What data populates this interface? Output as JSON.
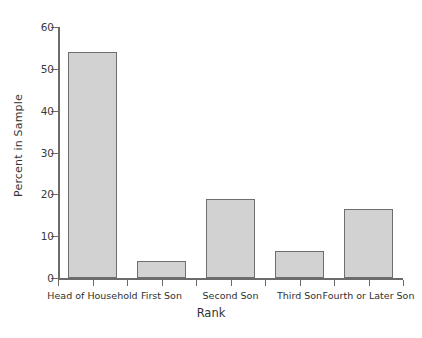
{
  "chart_data": {
    "type": "bar",
    "title": "",
    "xlabel": "Rank",
    "ylabel": "Percent in Sample",
    "categories": [
      "Head of Household",
      "First Son",
      "Second Son",
      "Third Son",
      "Fourth or Later Son"
    ],
    "values": [
      54,
      4,
      19,
      6.5,
      16.5
    ],
    "ylim": [
      0,
      60
    ],
    "yticks": [
      0,
      10,
      20,
      30,
      40,
      50,
      60
    ],
    "ytick_labels": [
      "0",
      "10",
      "20",
      "30",
      "40",
      "50",
      "60"
    ],
    "grid": false,
    "legend": null,
    "bar_fill_color": "#d2d2d2",
    "bar_edge_color": "#6e6e6e",
    "axis_color": "#6b6b6b",
    "background_color": "#ffffff"
  }
}
